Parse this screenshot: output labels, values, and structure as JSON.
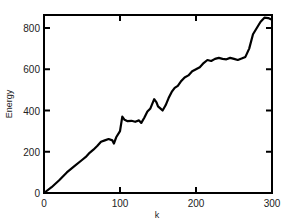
{
  "chart_data": {
    "type": "line",
    "title": "",
    "xlabel": "k",
    "ylabel": "Energy",
    "xlim": [
      0,
      300
    ],
    "ylim": [
      0,
      860
    ],
    "xticks": [
      0,
      100,
      200,
      300
    ],
    "yticks": [
      0,
      200,
      400,
      600,
      800
    ],
    "grid": false,
    "legend": null,
    "series": [
      {
        "name": "Energy",
        "color": "#000000",
        "x": [
          0,
          10,
          20,
          30,
          40,
          50,
          55,
          60,
          65,
          70,
          75,
          80,
          85,
          90,
          92,
          95,
          100,
          103,
          106,
          110,
          115,
          120,
          125,
          128,
          132,
          136,
          140,
          145,
          148,
          150,
          153,
          156,
          160,
          164,
          168,
          172,
          176,
          180,
          185,
          190,
          195,
          200,
          205,
          210,
          215,
          220,
          225,
          230,
          235,
          240,
          245,
          250,
          255,
          260,
          265,
          270,
          275,
          280,
          285,
          290,
          295,
          300
        ],
        "values": [
          0,
          28,
          62,
          100,
          130,
          160,
          175,
          195,
          210,
          228,
          248,
          255,
          262,
          255,
          240,
          270,
          300,
          370,
          355,
          348,
          350,
          345,
          352,
          340,
          365,
          395,
          410,
          455,
          440,
          420,
          410,
          400,
          425,
          460,
          490,
          510,
          520,
          540,
          560,
          570,
          590,
          600,
          610,
          630,
          645,
          640,
          650,
          655,
          650,
          648,
          655,
          650,
          645,
          652,
          660,
          700,
          770,
          800,
          830,
          850,
          848,
          840
        ]
      }
    ]
  }
}
